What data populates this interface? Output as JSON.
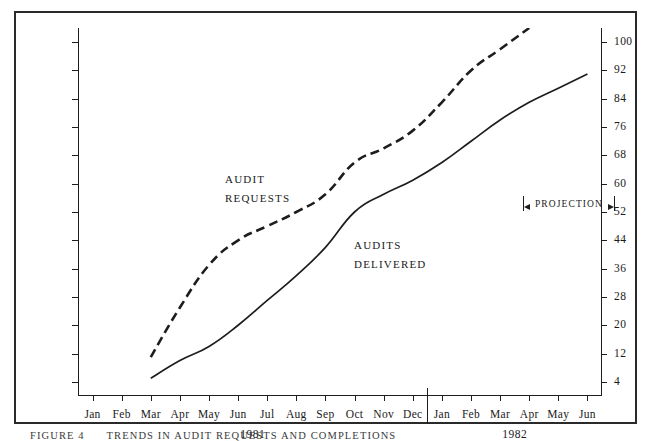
{
  "figure": {
    "caption_number": "FIGURE 4",
    "caption_text": "TRENDS IN AUDIT REQUESTS AND COMPLETIONS"
  },
  "chart_data": {
    "type": "line",
    "title": "",
    "xlabel": "",
    "ylabel": "",
    "grid": false,
    "legend_position": "inline-annotations",
    "ylim": [
      0,
      104
    ],
    "yticks": [
      4,
      12,
      20,
      28,
      36,
      44,
      52,
      60,
      68,
      76,
      84,
      92,
      100
    ],
    "ytick_labels": [
      "4",
      "12",
      "20",
      "28",
      "36",
      "44",
      "52",
      "60",
      "68",
      "76",
      "84",
      "92",
      "100"
    ],
    "dual_y_axis": true,
    "categories": [
      "Jan",
      "Feb",
      "Mar",
      "Apr",
      "May",
      "Jun",
      "Jul",
      "Aug",
      "Sep",
      "Oct",
      "Nov",
      "Dec",
      "Jan",
      "Feb",
      "Mar",
      "Apr",
      "May",
      "Jun"
    ],
    "year_groups": [
      {
        "label": "1981",
        "start_index": 0,
        "end_index": 11
      },
      {
        "label": "1982",
        "start_index": 12,
        "end_index": 17
      }
    ],
    "series": [
      {
        "name": "AUDIT REQUESTS",
        "style": "dashed",
        "label_lines": [
          "AUDIT",
          "REQUESTS"
        ],
        "values": [
          null,
          null,
          11,
          25,
          37,
          44,
          48,
          52,
          57,
          66,
          70,
          75,
          83,
          92,
          98,
          104,
          null,
          null
        ]
      },
      {
        "name": "AUDITS DELIVERED",
        "style": "solid",
        "label_lines": [
          "AUDITS",
          "DELIVERED"
        ],
        "values": [
          null,
          null,
          5,
          10,
          14,
          20,
          27,
          34,
          42,
          52,
          57,
          61,
          66,
          72,
          78,
          83,
          87,
          91
        ]
      }
    ],
    "annotations": [
      {
        "name": "projection-bracket",
        "text": "PROJECTION",
        "start_category": "Mar",
        "start_year": "1982",
        "end_category": "Jun",
        "end_year": "1982",
        "value": 60
      }
    ],
    "colors": {
      "ink": "#1d1d1d",
      "background": "#ffffff"
    }
  }
}
